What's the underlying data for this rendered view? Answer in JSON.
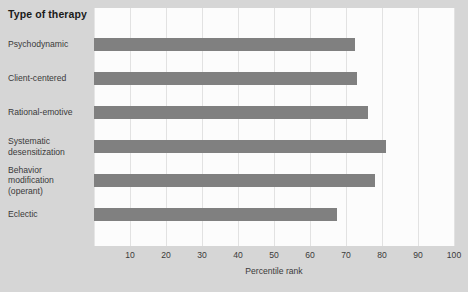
{
  "chart_data": {
    "type": "bar",
    "orientation": "horizontal",
    "title": "Type of therapy",
    "xlabel": "Percentile rank",
    "ylabel": "Type of therapy",
    "categories": [
      "Psychodynamic",
      "Client-centered",
      "Rational-emotive",
      "Systematic desensitization",
      "Behavior modification (operant)",
      "Eclectic"
    ],
    "category_lines": [
      [
        "Psychodynamic"
      ],
      [
        "Client-centered"
      ],
      [
        "Rational-emotive"
      ],
      [
        "Systematic",
        "desensitization"
      ],
      [
        "Behavior",
        "modification",
        "(operant)"
      ],
      [
        "Eclectic"
      ]
    ],
    "values": [
      72.5,
      73,
      76,
      81,
      78,
      67.5
    ],
    "xlim": [
      0,
      100
    ],
    "xticks": [
      10,
      20,
      30,
      40,
      50,
      60,
      70,
      80,
      90,
      100
    ],
    "xtick_labels": [
      "10",
      "20",
      "30",
      "40",
      "50",
      "60",
      "70",
      "80",
      "90",
      "100"
    ],
    "grid": true,
    "legend": false,
    "bar_color": "#808080",
    "plot_background": "#fcfcfc",
    "page_background": "#d6d6d6",
    "grid_color": "#e2e2e2"
  }
}
